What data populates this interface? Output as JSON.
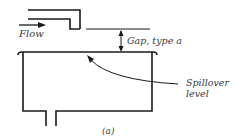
{
  "diagram": {
    "labels": {
      "flow": "Flow",
      "gap": "Gap, type a",
      "spillover_line1": "Spillover",
      "spillover_line2": "level",
      "caption": "(a)"
    },
    "colors": {
      "stroke": "#1a1a1a",
      "text": "#3a3a3a"
    }
  }
}
